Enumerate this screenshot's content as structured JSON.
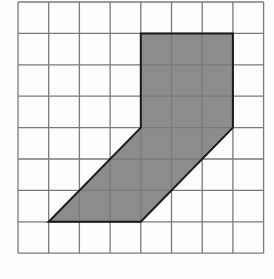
{
  "diagram": {
    "type": "grid-polygon",
    "grid": {
      "columns": 8,
      "rows": 8,
      "origin_px": [
        18,
        2
      ],
      "cell_w": 30.7,
      "cell_h": 31.4,
      "line_color": "#7a7a7a",
      "line_width": 1.3
    },
    "shape": {
      "vertices_grid": [
        [
          4,
          1
        ],
        [
          7,
          1
        ],
        [
          7,
          4
        ],
        [
          4,
          7
        ],
        [
          1,
          7
        ],
        [
          4,
          4
        ]
      ],
      "fill_color": "#8c8c8c",
      "stroke_color": "#1a1a1a",
      "stroke_width": 2
    },
    "background_color": "#fdfdfd"
  }
}
